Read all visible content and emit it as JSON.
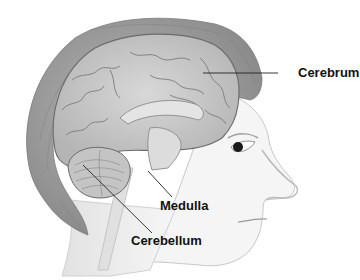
{
  "diagram": {
    "labels": [
      {
        "id": "cerebrum",
        "text": "Cerebrum"
      },
      {
        "id": "medulla",
        "text": "Medulla"
      },
      {
        "id": "cerebellum",
        "text": "Cerebellum"
      }
    ]
  },
  "colors": {
    "background": "#ffffff",
    "label_text": "#111111",
    "leader_line": "#222222",
    "skin": "#f4f4f4",
    "hair": "#9a9a9a",
    "brain": "#c9c9c9",
    "brain_outline": "#6a6a6a"
  }
}
